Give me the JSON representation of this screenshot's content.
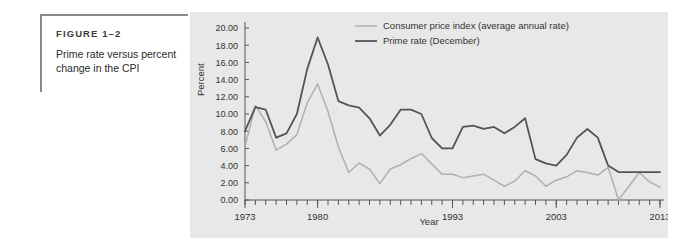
{
  "figure": {
    "label": "FIGURE 1–2",
    "title": "Prime rate versus percent change in the CPI"
  },
  "colors": {
    "panel_background": "#e8e8e8",
    "page_background": "#ffffff",
    "prime_rate_line": "#545454",
    "cpi_line": "#b0b0b0",
    "axis": "#555555",
    "caption_rule": "#8a8a8a",
    "text": "#333333"
  },
  "chart_data": {
    "type": "line",
    "title": "",
    "xlabel": "Year",
    "ylabel": "Percent",
    "xlim": [
      1973,
      2013
    ],
    "ylim": [
      0,
      20
    ],
    "ytick_step": 2,
    "grid": false,
    "legend_position": "top-center",
    "ytick_labels": [
      "0.00",
      "2.00",
      "4.00",
      "6.00",
      "8.00",
      "10.00",
      "12.00",
      "14.00",
      "16.00",
      "18.00",
      "20.00"
    ],
    "xtick_labels": [
      "1973",
      "1980",
      "1993",
      "2003",
      "2013"
    ],
    "xtick_values": [
      1973,
      1980,
      1993,
      2003,
      2013
    ],
    "x": [
      1973,
      1974,
      1975,
      1976,
      1977,
      1978,
      1979,
      1980,
      1981,
      1982,
      1983,
      1984,
      1985,
      1986,
      1987,
      1988,
      1989,
      1990,
      1991,
      1992,
      1993,
      1994,
      1995,
      1996,
      1997,
      1998,
      1999,
      2000,
      2001,
      2002,
      2003,
      2004,
      2005,
      2006,
      2007,
      2008,
      2009,
      2010,
      2011,
      2012,
      2013
    ],
    "series": [
      {
        "name": "Prime rate (December)",
        "label": "Prime rate (December)",
        "color": "#545454",
        "values": [
          8.0,
          10.8,
          10.5,
          7.25,
          7.75,
          10.0,
          15.25,
          18.9,
          15.75,
          11.5,
          11.0,
          10.75,
          9.5,
          7.5,
          8.75,
          10.5,
          10.5,
          10.0,
          7.21,
          6.0,
          6.0,
          8.5,
          8.65,
          8.27,
          8.5,
          7.75,
          8.5,
          9.5,
          4.75,
          4.25,
          4.0,
          5.25,
          7.25,
          8.25,
          7.25,
          4.0,
          3.25,
          3.25,
          3.25,
          3.25,
          3.25
        ]
      },
      {
        "name": "Consumer price index (average annual rate)",
        "label": "Consumer price index (average annual rate)",
        "color": "#b0b0b0",
        "values": [
          6.2,
          11.0,
          9.1,
          5.8,
          6.5,
          7.6,
          11.3,
          13.5,
          10.3,
          6.2,
          3.2,
          4.3,
          3.6,
          1.9,
          3.6,
          4.1,
          4.8,
          5.4,
          4.2,
          3.0,
          3.0,
          2.6,
          2.8,
          3.0,
          2.3,
          1.6,
          2.2,
          3.4,
          2.8,
          1.6,
          2.3,
          2.7,
          3.4,
          3.2,
          2.9,
          3.8,
          -0.4,
          1.6,
          3.2,
          2.1,
          1.5
        ]
      }
    ]
  }
}
